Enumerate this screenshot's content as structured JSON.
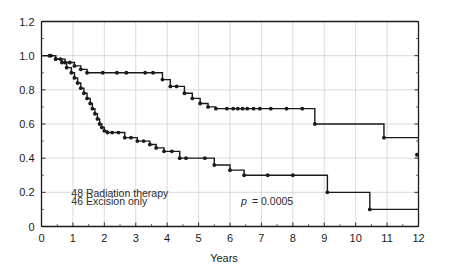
{
  "chart_data": {
    "type": "line",
    "title": "",
    "xlabel": "Years",
    "ylabel": "",
    "xlim": [
      0,
      12
    ],
    "ylim": [
      0,
      1.2
    ],
    "grid": true,
    "legend_position": "inside-lower-left",
    "x_ticks": [
      "0",
      "1",
      "2",
      "3",
      "4",
      "5",
      "6",
      "7",
      "8",
      "9",
      "10",
      "11",
      "12"
    ],
    "x_tick_values": [
      0,
      1,
      2,
      3,
      4,
      5,
      6,
      7,
      8,
      9,
      10,
      11,
      12
    ],
    "y_ticks": [
      "0",
      "0.2",
      "0.4",
      "0.6",
      "0.8",
      "1.0",
      "1.2"
    ],
    "y_tick_values": [
      0,
      0.2,
      0.4,
      0.6,
      0.8,
      1.0,
      1.2
    ],
    "y_minor_tick_values": [
      0.1,
      0.3,
      0.5,
      0.7,
      0.9,
      1.1
    ],
    "annotations": [
      {
        "name": "legend-radiation",
        "text": "48 Radiation therapy",
        "x": 0.95,
        "y": 0.175
      },
      {
        "name": "legend-excision",
        "text": "46 Excision only",
        "x": 0.95,
        "y": 0.125
      },
      {
        "name": "pvalue-italic",
        "text": "p",
        "x": 6.35,
        "y": 0.125
      },
      {
        "name": "pvalue-rest",
        "text": "= 0.0005",
        "x": 6.7,
        "y": 0.125
      }
    ],
    "series": [
      {
        "name": "48 Radiation therapy",
        "n": 48,
        "color": "#1a1a1a",
        "step": "post",
        "x": [
          0.0,
          0.3,
          0.45,
          0.6,
          0.75,
          0.9,
          1.05,
          1.25,
          1.45,
          1.7,
          1.95,
          2.15,
          2.4,
          2.7,
          3.0,
          3.3,
          3.55,
          3.85,
          4.1,
          4.3,
          4.55,
          4.8,
          5.05,
          5.3,
          5.55,
          5.8,
          6.05,
          6.3,
          6.55,
          6.8,
          7.05,
          7.3,
          7.55,
          7.8,
          8.05,
          8.3,
          8.55,
          8.7,
          9.1,
          9.6,
          10.1,
          10.6,
          10.9,
          11.4,
          12.0
        ],
        "y": [
          1.0,
          1.0,
          0.98,
          0.98,
          0.96,
          0.96,
          0.94,
          0.92,
          0.9,
          0.9,
          0.9,
          0.9,
          0.9,
          0.9,
          0.9,
          0.9,
          0.9,
          0.86,
          0.82,
          0.82,
          0.78,
          0.75,
          0.72,
          0.7,
          0.69,
          0.69,
          0.69,
          0.69,
          0.69,
          0.69,
          0.69,
          0.69,
          0.69,
          0.69,
          0.69,
          0.69,
          0.69,
          0.6,
          0.6,
          0.6,
          0.6,
          0.6,
          0.52,
          0.52,
          0.52
        ],
        "censor_x": [
          0.3,
          0.45,
          0.6,
          0.75,
          0.9,
          1.05,
          1.25,
          1.45,
          1.95,
          2.4,
          2.7,
          3.3,
          3.55,
          3.85,
          4.1,
          4.3,
          4.55,
          4.8,
          5.05,
          5.3,
          5.55,
          5.9,
          6.1,
          6.25,
          6.4,
          6.55,
          6.75,
          6.95,
          7.3,
          7.8,
          8.3,
          8.7,
          10.9,
          11.95
        ],
        "censor_y": [
          1.0,
          0.98,
          0.98,
          0.96,
          0.96,
          0.94,
          0.92,
          0.9,
          0.9,
          0.9,
          0.9,
          0.9,
          0.9,
          0.86,
          0.82,
          0.82,
          0.78,
          0.75,
          0.72,
          0.7,
          0.69,
          0.69,
          0.69,
          0.69,
          0.69,
          0.69,
          0.69,
          0.69,
          0.69,
          0.69,
          0.69,
          0.6,
          0.52,
          0.42
        ]
      },
      {
        "name": "46 Excision only",
        "n": 46,
        "color": "#1a1a1a",
        "step": "post",
        "x": [
          0.0,
          0.25,
          0.45,
          0.65,
          0.8,
          0.95,
          1.05,
          1.15,
          1.25,
          1.35,
          1.45,
          1.55,
          1.62,
          1.7,
          1.78,
          1.85,
          1.92,
          2.0,
          2.1,
          2.25,
          2.45,
          2.65,
          2.85,
          3.05,
          3.25,
          3.45,
          3.65,
          3.9,
          4.15,
          4.4,
          4.6,
          4.9,
          5.2,
          5.5,
          6.0,
          6.45,
          6.6,
          7.2,
          8.0,
          8.9,
          9.1,
          9.9,
          10.45,
          11.2,
          12.0
        ],
        "y": [
          1.0,
          1.0,
          0.98,
          0.96,
          0.93,
          0.9,
          0.87,
          0.84,
          0.81,
          0.78,
          0.75,
          0.72,
          0.69,
          0.66,
          0.63,
          0.6,
          0.58,
          0.56,
          0.55,
          0.55,
          0.55,
          0.52,
          0.52,
          0.5,
          0.5,
          0.48,
          0.46,
          0.44,
          0.44,
          0.4,
          0.4,
          0.4,
          0.4,
          0.36,
          0.33,
          0.3,
          0.3,
          0.3,
          0.3,
          0.3,
          0.2,
          0.2,
          0.1,
          0.1,
          0.1
        ],
        "censor_x": [
          0.25,
          0.45,
          0.65,
          0.8,
          0.95,
          1.05,
          1.15,
          1.25,
          1.35,
          1.45,
          1.55,
          1.62,
          1.7,
          1.78,
          1.85,
          1.92,
          2.0,
          2.1,
          2.25,
          2.45,
          2.65,
          2.85,
          3.05,
          3.25,
          3.45,
          3.65,
          3.9,
          4.15,
          4.4,
          4.6,
          5.2,
          5.5,
          6.0,
          6.45,
          7.2,
          8.0,
          9.1,
          10.45
        ],
        "censor_y": [
          1.0,
          0.98,
          0.96,
          0.93,
          0.9,
          0.87,
          0.84,
          0.81,
          0.78,
          0.75,
          0.72,
          0.69,
          0.66,
          0.63,
          0.6,
          0.58,
          0.56,
          0.55,
          0.55,
          0.55,
          0.52,
          0.52,
          0.5,
          0.5,
          0.48,
          0.46,
          0.44,
          0.44,
          0.4,
          0.4,
          0.4,
          0.36,
          0.33,
          0.3,
          0.3,
          0.3,
          0.2,
          0.1
        ]
      }
    ]
  }
}
